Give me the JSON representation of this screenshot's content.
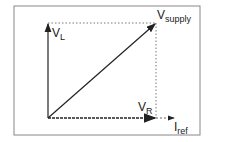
{
  "diagram": {
    "type": "phasor-diagram",
    "labels": {
      "v_l": {
        "main": "V",
        "sub": "L"
      },
      "v_supply": {
        "main": "V",
        "sub": "supply"
      },
      "v_r": {
        "main": "V",
        "sub": "R"
      },
      "i_ref": {
        "main": "I",
        "sub": "ref"
      }
    },
    "colors": {
      "line": "#222222",
      "frame": "#888888",
      "guide": "#555555"
    }
  }
}
